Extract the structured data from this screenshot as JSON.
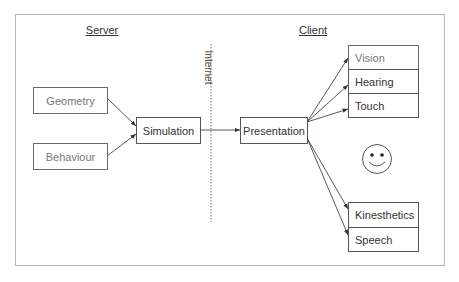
{
  "diagram": {
    "sections": {
      "server": "Server",
      "client": "Client"
    },
    "divider_label": "Internet",
    "nodes": {
      "geometry": "Geometry",
      "behaviour": "Behaviour",
      "simulation": "Simulation",
      "presentation": "Presentation",
      "vision": "Vision",
      "hearing": "Hearing",
      "touch": "Touch",
      "kinesthetics": "Kinesthetics",
      "speech": "Speech"
    },
    "user_icon": "smiley-face-icon",
    "edges": [
      {
        "from": "Geometry",
        "to": "Simulation"
      },
      {
        "from": "Behaviour",
        "to": "Simulation"
      },
      {
        "from": "Simulation",
        "to": "Presentation"
      },
      {
        "from": "Presentation",
        "to": "Vision"
      },
      {
        "from": "Presentation",
        "to": "Hearing"
      },
      {
        "from": "Presentation",
        "to": "Touch"
      },
      {
        "from": "Presentation",
        "to": "Kinesthetics"
      },
      {
        "from": "Presentation",
        "to": "Speech"
      }
    ],
    "colors": {
      "line": "#444444",
      "frame": "#b8b8b8",
      "text": "#333333"
    }
  }
}
